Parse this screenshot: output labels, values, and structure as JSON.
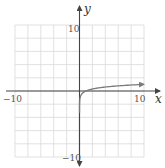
{
  "chart_data": {
    "type": "line",
    "title": "",
    "xlabel": "x",
    "ylabel": "y",
    "xlim": [
      -10,
      10
    ],
    "ylim": [
      -10,
      10
    ],
    "grid": true,
    "grid_step": 2,
    "tick_labels": {
      "x_min": "−10",
      "x_max": "10",
      "y_max": "10",
      "y_min": "−10"
    },
    "series": [
      {
        "name": "y = log x",
        "function": "log10(x)",
        "x": [
          0.001,
          0.01,
          0.05,
          0.1,
          0.25,
          0.5,
          1,
          2,
          3,
          4,
          5,
          6,
          7,
          8,
          9,
          10
        ],
        "y": [
          -3,
          -2,
          -1.3,
          -1,
          -0.6,
          -0.3,
          0,
          0.3,
          0.48,
          0.6,
          0.7,
          0.78,
          0.85,
          0.9,
          0.95,
          1
        ],
        "color": "#7a7a7a",
        "arrow_end": true
      }
    ],
    "legend": null
  },
  "colors": {
    "grid": "#d9d9d9",
    "axis": "#444444",
    "curve": "#7a7a7a",
    "background": "#ffffff"
  }
}
